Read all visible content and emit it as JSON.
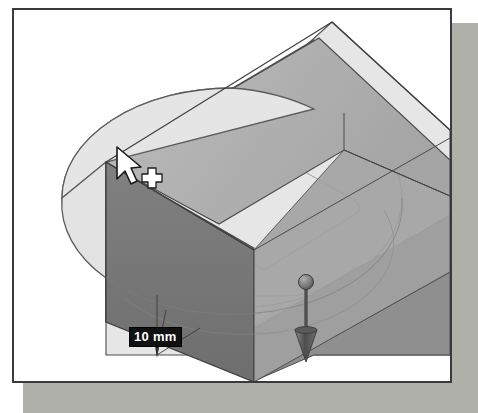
{
  "app": {
    "title": "3D Extrude Preview Viewport",
    "kind": "cad-modeling-viewport"
  },
  "viewport": {
    "background_color": "#ffffff",
    "frame_border_color": "#3a3a3a",
    "frame_shadow_color": "#a9a9a4"
  },
  "dimension": {
    "value_label": "10 mm",
    "text_color": "#ffffff",
    "background_color": "#111111"
  },
  "model": {
    "sketch_profile_name": "ellipse-profile",
    "sketch_profile_fill": "#e9e9e9",
    "sketch_profile_stroke": "#6e6e6e",
    "faces": [
      {
        "name": "extrude-top-face",
        "shade": "#b3b3b3"
      },
      {
        "name": "extrude-front-left-face",
        "shade": "#767676"
      },
      {
        "name": "extrude-front-right-face",
        "shade": "#8d8d8d"
      },
      {
        "name": "extrude-right-end-face",
        "shade": "#9b9b9b"
      },
      {
        "name": "base-plane-face",
        "shade": "#e4e4e4"
      },
      {
        "name": "base-plane-lower-face",
        "shade": "#8a8a8a"
      }
    ],
    "edge_color": "#4a4a4a"
  },
  "manipulator": {
    "name": "extrude-direction-arrow",
    "handle_shape": "sphere",
    "arrow_shape": "cone",
    "color": "#5c5c5c",
    "direction": "down"
  },
  "cursor": {
    "pointer_icon": "arrow-pointer-icon",
    "modifier_icon": "crosshair-plus-icon",
    "fill": "#ffffff",
    "stroke": "#1a1a1a"
  }
}
